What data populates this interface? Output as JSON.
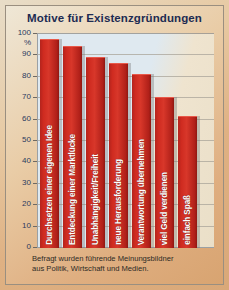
{
  "title": "Motive für Existenzgründungen",
  "footnote_line1": "Befragt wurden führende Meinungsbildner",
  "footnote_line2": "aus Politik, Wirtschaft und Medien.",
  "axis": {
    "unit": "%",
    "ticks": [
      "100",
      "90",
      "80",
      "70",
      "60",
      "50",
      "40",
      "30",
      "20",
      "10",
      "0"
    ]
  },
  "colors": {
    "bar": "#cf2b20",
    "title": "#1d2b52",
    "plot_bg": "#dfe9f0",
    "card_bg": "#e3bf93"
  },
  "chart_data": {
    "type": "bar",
    "title": "Motive für Existenzgründungen",
    "xlabel": "",
    "ylabel": "%",
    "ylim": [
      0,
      100
    ],
    "grid": true,
    "legend": "none",
    "categories": [
      "Durchsetzen einer eigenen Idee",
      "Entdeckung einer Marktlücke",
      "Unabhängigkeit/Freiheit",
      "neue Herausforderung",
      "Verantwortung übernehmen",
      "viel Geld verdienen",
      "einfach Spaß"
    ],
    "values": [
      97,
      94,
      89,
      86,
      81,
      70,
      61
    ],
    "annotation": "Befragt wurden führende Meinungsbildner aus Politik, Wirtschaft und Medien."
  }
}
